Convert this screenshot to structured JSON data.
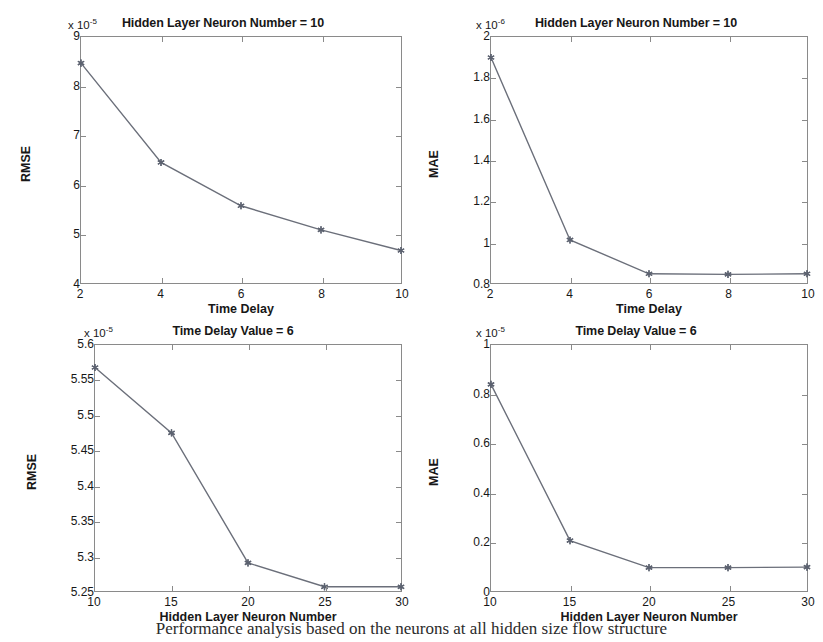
{
  "figure": {
    "caption_fragment": "Performance analysis based on the neurons at all hidden size flow structure",
    "line_color": "#6b6f7a",
    "marker_color": "#5c6270",
    "axis_color": "#8a8a8a",
    "background": "#ffffff"
  },
  "chart_data": [
    {
      "id": "rmse-vs-time-delay",
      "type": "line",
      "title": "Hidden Layer Neuron Number = 10",
      "xlabel": "Time Delay",
      "ylabel": "RMSE",
      "y_multiplier": "x 10",
      "y_exponent": "-5",
      "x": [
        2,
        4,
        6,
        8,
        10
      ],
      "values": [
        8.47,
        6.45,
        5.57,
        5.08,
        4.66
      ],
      "xlim": [
        2,
        10
      ],
      "ylim": [
        4,
        9
      ],
      "xticks": [
        2,
        4,
        6,
        8,
        10
      ],
      "yticks": [
        4,
        5,
        6,
        7,
        8,
        9
      ],
      "xticklabels": [
        "2",
        "4",
        "6",
        "8",
        "10"
      ],
      "yticklabels": [
        "4",
        "5",
        "6",
        "7",
        "8",
        "9"
      ],
      "grid": false,
      "marker": "star"
    },
    {
      "id": "mae-vs-time-delay",
      "type": "line",
      "title": "Hidden Layer Neuron Number = 10",
      "xlabel": "Time Delay",
      "ylabel": "MAE",
      "y_multiplier": "x 10",
      "y_exponent": "-6",
      "x": [
        2,
        4,
        6,
        8,
        10
      ],
      "values": [
        1.9,
        1.01,
        0.845,
        0.842,
        0.845
      ],
      "xlim": [
        2,
        10
      ],
      "ylim": [
        0.8,
        2.0
      ],
      "xticks": [
        2,
        4,
        6,
        8,
        10
      ],
      "yticks": [
        0.8,
        1.0,
        1.2,
        1.4,
        1.6,
        1.8,
        2.0
      ],
      "xticklabels": [
        "2",
        "4",
        "6",
        "8",
        "10"
      ],
      "yticklabels": [
        "0.8",
        "1",
        "1.2",
        "1.4",
        "1.6",
        "1.8",
        "2"
      ],
      "grid": false,
      "marker": "star"
    },
    {
      "id": "rmse-vs-neuron-number",
      "type": "line",
      "title": "Time Delay Value = 6",
      "xlabel": "Hidden Layer Neuron Number",
      "ylabel": "RMSE",
      "y_multiplier": "x 10",
      "y_exponent": "-5",
      "x": [
        10,
        15,
        20,
        25,
        30
      ],
      "values": [
        5.568,
        5.475,
        5.29,
        5.256,
        5.256
      ],
      "xlim": [
        10,
        30
      ],
      "ylim": [
        5.25,
        5.6
      ],
      "xticks": [
        10,
        15,
        20,
        25,
        30
      ],
      "yticks": [
        5.25,
        5.3,
        5.35,
        5.4,
        5.45,
        5.5,
        5.55,
        5.6
      ],
      "xticklabels": [
        "10",
        "15",
        "20",
        "25",
        "30"
      ],
      "yticklabels": [
        "5.25",
        "5.3",
        "5.35",
        "5.4",
        "5.45",
        "5.5",
        "5.55",
        "5.6"
      ],
      "grid": false,
      "marker": "star"
    },
    {
      "id": "mae-vs-neuron-number",
      "type": "line",
      "title": "Time Delay Value = 6",
      "xlabel": "Hidden Layer Neuron Number",
      "ylabel": "MAE",
      "y_multiplier": "x 10",
      "y_exponent": "-5",
      "x": [
        10,
        15,
        20,
        25,
        30
      ],
      "values": [
        0.84,
        0.205,
        0.095,
        0.095,
        0.097
      ],
      "xlim": [
        10,
        30
      ],
      "ylim": [
        0,
        1
      ],
      "xticks": [
        10,
        15,
        20,
        25,
        30
      ],
      "yticks": [
        0,
        0.2,
        0.4,
        0.6,
        0.8,
        1.0
      ],
      "xticklabels": [
        "10",
        "15",
        "20",
        "25",
        "30"
      ],
      "yticklabels": [
        "0",
        "0.2",
        "0.4",
        "0.6",
        "0.8",
        "1"
      ],
      "grid": false,
      "marker": "star"
    }
  ]
}
